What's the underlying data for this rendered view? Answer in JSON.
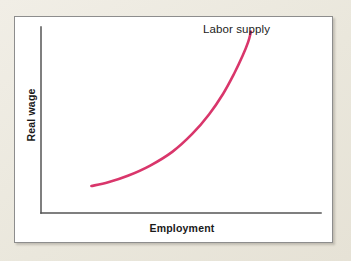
{
  "figure": {
    "panel_background": "#ffffff",
    "panel_border_color": "#8d8d8d",
    "page_background": "#edeae0"
  },
  "chart_data": {
    "type": "line",
    "title": "",
    "subtitle": "",
    "xlabel": "Employment",
    "ylabel": "Real wage",
    "grid": false,
    "legend_position": "none",
    "annotations": [
      {
        "name": "curve-label",
        "text": "Labor supply",
        "x": 0.62,
        "y": 0.97
      }
    ],
    "axes": {
      "x_axis_color": "#555555",
      "y_axis_color": "#555555",
      "x_ticks": [],
      "y_ticks": [],
      "xlim": [
        0,
        1
      ],
      "ylim": [
        0,
        1
      ]
    },
    "series": [
      {
        "name": "Labor supply",
        "color": "#d9366b",
        "line_width": 2.6,
        "x": [
          0.18,
          0.24,
          0.31,
          0.39,
          0.47,
          0.54,
          0.6,
          0.65,
          0.69,
          0.72,
          0.74,
          0.75
        ],
        "y": [
          0.145,
          0.165,
          0.2,
          0.255,
          0.33,
          0.425,
          0.53,
          0.64,
          0.75,
          0.845,
          0.92,
          0.975
        ]
      }
    ]
  },
  "labels": {
    "x_axis": "Employment",
    "y_axis": "Real wage",
    "curve": "Labor supply"
  }
}
